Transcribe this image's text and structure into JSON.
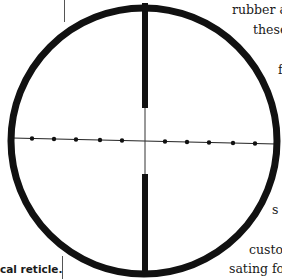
{
  "figure": {
    "type": "reticle-diagram",
    "circle": {
      "cx": 144,
      "cy": 141,
      "r": 133,
      "stroke_width": 7,
      "color": "#111111"
    },
    "top_post": {
      "x": 142,
      "y1": 3,
      "y2": 108,
      "width": 6
    },
    "bottom_post": {
      "x": 142,
      "y1": 174,
      "y2": 276,
      "width": 6
    },
    "vertical_hairline": {
      "x": 145,
      "y1": 108,
      "y2": 174
    },
    "horizontal_hairline": {
      "x1": 12,
      "y1": 138,
      "x2": 276,
      "y2": 144
    },
    "dots_left": [
      32,
      54,
      76,
      100,
      122
    ],
    "dots_right": [
      165,
      187,
      209,
      233,
      255
    ],
    "dot_radius": 2.2
  },
  "caption": {
    "text": "cal reticle."
  },
  "body_text_lines": [
    {
      "text": "rubber a",
      "x": 232,
      "y": 4
    },
    {
      "text": "these",
      "x": 253,
      "y": 24
    },
    {
      "text": "f",
      "x": 278,
      "y": 64
    },
    {
      "text": "s",
      "x": 272,
      "y": 204
    },
    {
      "text": "custo",
      "x": 249,
      "y": 244
    },
    {
      "text": "sating for",
      "x": 229,
      "y": 263
    }
  ]
}
